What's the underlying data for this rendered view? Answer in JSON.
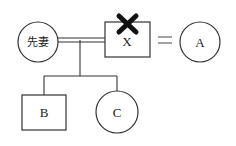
{
  "diagram": {
    "type": "family-tree",
    "nodes": {
      "former_wife": {
        "label": "先妻",
        "shape": "circle"
      },
      "x": {
        "label": "X",
        "shape": "square",
        "deceased_mark": "✖"
      },
      "a": {
        "label": "A",
        "shape": "circle"
      },
      "b": {
        "label": "B",
        "shape": "square"
      },
      "c": {
        "label": "C",
        "shape": "circle"
      }
    },
    "relations": {
      "marriage_former": "double-line between 先妻 and X",
      "marriage_current": "=",
      "children_of_former_marriage": [
        "B",
        "C"
      ]
    },
    "equals_symbol": "="
  },
  "colors": {
    "line": "#333333",
    "background": "#ffffff",
    "mark": "#111111"
  }
}
